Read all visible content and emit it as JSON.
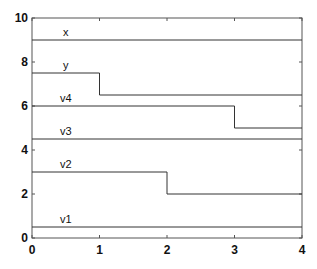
{
  "chart_data": {
    "type": "line",
    "step": true,
    "title": "",
    "xlabel": "",
    "ylabel": "",
    "xlim": [
      0,
      4
    ],
    "ylim": [
      0,
      10
    ],
    "xticks": [
      0,
      1,
      2,
      3,
      4
    ],
    "xtick_labels": [
      "0",
      "1",
      "2",
      "3",
      "4"
    ],
    "yticks": [
      0,
      2,
      4,
      6,
      8,
      10
    ],
    "ytick_labels": [
      "0",
      "2",
      "4",
      "6",
      "8",
      "10"
    ],
    "grid": false,
    "legend": "none (inline labels above each line)",
    "series": [
      {
        "name": "x",
        "x": [
          0,
          4
        ],
        "y": [
          9,
          9
        ]
      },
      {
        "name": "y",
        "x": [
          0,
          1,
          1,
          4
        ],
        "y": [
          7.5,
          7.5,
          6.5,
          6.5
        ]
      },
      {
        "name": "v4",
        "x": [
          0,
          3,
          3,
          4
        ],
        "y": [
          6,
          6,
          5,
          5
        ]
      },
      {
        "name": "v3",
        "x": [
          0,
          4
        ],
        "y": [
          4.5,
          4.5
        ]
      },
      {
        "name": "v2",
        "x": [
          0,
          2,
          2,
          4
        ],
        "y": [
          3,
          3,
          2,
          2
        ]
      },
      {
        "name": "v1",
        "x": [
          0,
          4
        ],
        "y": [
          0.5,
          0.5
        ]
      }
    ],
    "label_x": 0.5,
    "colors": {
      "line": "#333333",
      "axis": "#555555",
      "text": "#111111"
    }
  }
}
